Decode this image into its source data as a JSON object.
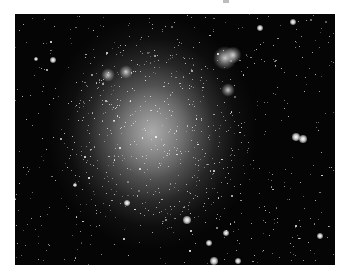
{
  "image": {
    "subject": "irregular dwarf galaxy star field",
    "frame": {
      "x": 15,
      "y": 14,
      "width": 320,
      "height": 251
    },
    "background_color": "#050505",
    "page_background": "#ffffff",
    "galaxy_glow": {
      "cx": 137,
      "cy": 118,
      "rx": 85,
      "ry": 95,
      "color": "#d8d8d8"
    },
    "nebula_knots": [
      {
        "x": 210,
        "y": 44,
        "r": 7
      },
      {
        "x": 218,
        "y": 41,
        "r": 5
      },
      {
        "x": 111,
        "y": 58,
        "r": 4
      },
      {
        "x": 93,
        "y": 61,
        "r": 4
      },
      {
        "x": 213,
        "y": 76,
        "r": 4
      }
    ],
    "bright_stars": [
      {
        "x": 281,
        "y": 123,
        "s": 4
      },
      {
        "x": 288,
        "y": 125,
        "s": 4
      },
      {
        "x": 172,
        "y": 206,
        "s": 4
      },
      {
        "x": 211,
        "y": 219,
        "s": 3
      },
      {
        "x": 194,
        "y": 229,
        "s": 3
      },
      {
        "x": 199,
        "y": 247,
        "s": 4
      },
      {
        "x": 223,
        "y": 247,
        "s": 3
      },
      {
        "x": 38,
        "y": 46,
        "s": 3
      },
      {
        "x": 278,
        "y": 8,
        "s": 3
      },
      {
        "x": 245,
        "y": 14,
        "s": 3
      },
      {
        "x": 21,
        "y": 45,
        "s": 2
      },
      {
        "x": 112,
        "y": 189,
        "s": 3
      },
      {
        "x": 60,
        "y": 171,
        "s": 2
      },
      {
        "x": 305,
        "y": 222,
        "s": 3
      }
    ],
    "faint_star_count": 900,
    "seed": 7
  }
}
